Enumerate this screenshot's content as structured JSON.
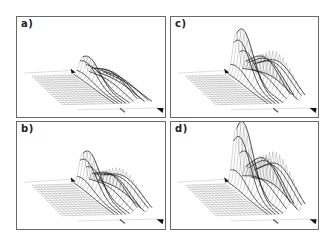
{
  "figure": {
    "panels": [
      {
        "id": "a",
        "label": "a)"
      },
      {
        "id": "b",
        "label": "b)"
      },
      {
        "id": "c",
        "label": "c)"
      },
      {
        "id": "d",
        "label": "d)"
      }
    ]
  },
  "chart_data": [
    {
      "type": "surface",
      "title": "a)",
      "description": "3D wireframe surface on a skewed grid plane; low ridges near the far-right corner",
      "grid": {
        "rows": 14,
        "cols": 24
      },
      "ridges": [
        {
          "position": 0.7,
          "relative_height": 0.35
        },
        {
          "position": 0.85,
          "relative_height": 0.25
        },
        {
          "position": 0.97,
          "relative_height": 0.15
        }
      ],
      "markers": [
        "arrow-upper",
        "tick-bottom",
        "arrow-lower-right"
      ],
      "xlabel": "",
      "ylabel": "",
      "zlabel": ""
    },
    {
      "type": "surface",
      "title": "b)",
      "description": "3D wireframe surface; moderate peak near back edge and rising ridge at right edge",
      "grid": {
        "rows": 14,
        "cols": 24
      },
      "ridges": [
        {
          "position": 0.7,
          "relative_height": 0.55
        },
        {
          "position": 0.85,
          "relative_height": 0.35
        },
        {
          "position": 0.98,
          "relative_height": 0.4
        }
      ],
      "markers": [
        "arrow-upper",
        "tick-bottom",
        "arrow-lower-right"
      ],
      "xlabel": "",
      "ylabel": "",
      "zlabel": ""
    },
    {
      "type": "surface",
      "title": "c)",
      "description": "3D wireframe surface; tall sharp peak at back with secondary peaks and steep edge rise",
      "grid": {
        "rows": 14,
        "cols": 24
      },
      "ridges": [
        {
          "position": 0.7,
          "relative_height": 0.8
        },
        {
          "position": 0.85,
          "relative_height": 0.5
        },
        {
          "position": 0.98,
          "relative_height": 0.55
        }
      ],
      "markers": [
        "arrow-upper",
        "tick-bottom",
        "arrow-lower-right"
      ],
      "xlabel": "",
      "ylabel": "",
      "zlabel": ""
    },
    {
      "type": "surface",
      "title": "d)",
      "description": "3D wireframe surface; tallest sharp peak at back, strong secondary peaks and steep right-edge rise",
      "grid": {
        "rows": 14,
        "cols": 24
      },
      "ridges": [
        {
          "position": 0.7,
          "relative_height": 1.0
        },
        {
          "position": 0.85,
          "relative_height": 0.6
        },
        {
          "position": 0.98,
          "relative_height": 0.65
        }
      ],
      "markers": [
        "arrow-upper",
        "tick-bottom",
        "arrow-lower-right"
      ],
      "xlabel": "",
      "ylabel": "",
      "zlabel": ""
    }
  ]
}
